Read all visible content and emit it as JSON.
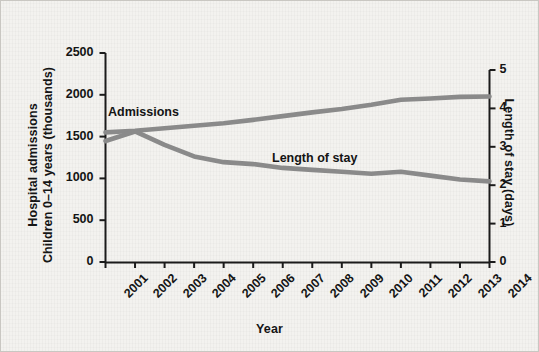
{
  "chart_data": {
    "type": "line",
    "title": "",
    "xlabel": "Year",
    "ylabel": "Hospital admissions Children 0–14 years (thousands)",
    "ylabel_left_line1": "Hospital admissions",
    "ylabel_left_line2": "Children 0–14 years (thousands)",
    "ylabel_right": "Length of stay (days)",
    "categories": [
      "2001",
      "2002",
      "2003",
      "2004",
      "2005",
      "2006",
      "2007",
      "2008",
      "2009",
      "2010",
      "2011",
      "2012",
      "2013",
      "2014"
    ],
    "x": [
      2001,
      2002,
      2003,
      2004,
      2005,
      2006,
      2007,
      2008,
      2009,
      2010,
      2011,
      2012,
      2013,
      2014
    ],
    "ylim": [
      0,
      2500
    ],
    "yticks": [
      "0",
      "500",
      "1000",
      "1500",
      "2000",
      "2500"
    ],
    "ytick_values": [
      0,
      500,
      1000,
      1500,
      2000,
      2500
    ],
    "ylim_right": [
      0,
      5
    ],
    "yticks_right": [
      "0",
      "1",
      "2",
      "3",
      "4",
      "5"
    ],
    "ytick_right_values": [
      0,
      1,
      2,
      3,
      4,
      5
    ],
    "grid": false,
    "legend_position": "inline-labels",
    "series": [
      {
        "name": "Admissions",
        "axis": "left",
        "units": "thousands",
        "color": "#8a8a8a",
        "label_text": "Admissions",
        "values": [
          1550,
          1570,
          1600,
          1630,
          1660,
          1700,
          1745,
          1790,
          1830,
          1880,
          1940,
          1955,
          1975,
          1980
        ]
      },
      {
        "name": "Length of stay",
        "axis": "right",
        "units": "days",
        "color": "#8a8a8a",
        "label_text": "Length of stay",
        "values": [
          3.15,
          3.4,
          3.05,
          2.75,
          2.6,
          2.55,
          2.45,
          2.4,
          2.35,
          2.3,
          2.35,
          2.25,
          2.15,
          2.1
        ]
      }
    ]
  },
  "figure": {
    "background_color": "#f3f2ef",
    "line_color": "#8a8a8a",
    "axis_color": "#1b1b1b",
    "text_color": "#141414"
  }
}
